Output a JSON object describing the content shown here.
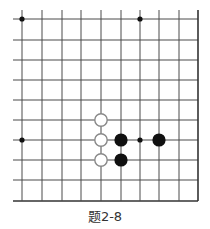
{
  "diagram": {
    "type": "go-board-problem",
    "caption": "题2-8",
    "board": {
      "columns_x": [
        22,
        42,
        62,
        81,
        101,
        121,
        140,
        159,
        179,
        198
      ],
      "rows_y": [
        19,
        40,
        60,
        80,
        100,
        120,
        140,
        160,
        180,
        201
      ],
      "open_left_x": 13,
      "open_top_y": 10,
      "closed_right": true,
      "closed_bottom": true,
      "line_color": "#4a4a4a",
      "edge_color": "#333333"
    },
    "star_points": [
      {
        "col": 0,
        "row": 0
      },
      {
        "col": 6,
        "row": 0
      },
      {
        "col": 0,
        "row": 6
      },
      {
        "col": 6,
        "row": 6
      }
    ],
    "stones": [
      {
        "color": "white",
        "col": 4,
        "row": 5
      },
      {
        "color": "white",
        "col": 4,
        "row": 6
      },
      {
        "color": "white",
        "col": 4,
        "row": 7
      },
      {
        "color": "black",
        "col": 5,
        "row": 6
      },
      {
        "color": "black",
        "col": 5,
        "row": 7
      },
      {
        "color": "black",
        "col": 7,
        "row": 6
      }
    ],
    "colors": {
      "black_stone": "#111111",
      "white_stone_fill": "#ffffff",
      "white_stone_stroke": "#888888",
      "star_point": "#111111"
    }
  }
}
